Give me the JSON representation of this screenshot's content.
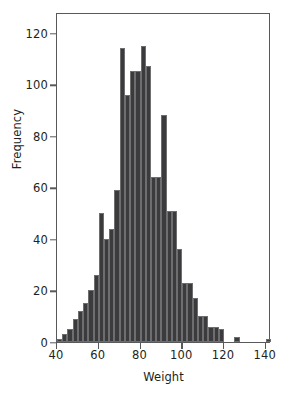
{
  "chart_data": {
    "type": "bar",
    "title": "",
    "subtitle": "",
    "xlabel": "Weight",
    "ylabel": "Frequency",
    "xlim": [
      40,
      142.5
    ],
    "ylim": [
      0,
      128
    ],
    "grid": false,
    "legend": null,
    "bin_width": 2.5,
    "bar_color": "#3b3b3d",
    "axis_color": "#58595b",
    "text_color": "#231f20",
    "xticks": [
      40,
      60,
      80,
      100,
      120,
      140
    ],
    "xtick_labels": [
      "40",
      "60",
      "80",
      "100",
      "120",
      "140"
    ],
    "yticks": [
      0,
      20,
      40,
      60,
      80,
      100,
      120
    ],
    "ytick_labels": [
      "0",
      "20",
      "40",
      "60",
      "80",
      "100",
      "120"
    ],
    "bins": [
      {
        "x0": 40.0,
        "x1": 42.5,
        "value": 1
      },
      {
        "x0": 42.5,
        "x1": 45.0,
        "value": 3
      },
      {
        "x0": 45.0,
        "x1": 47.5,
        "value": 5
      },
      {
        "x0": 47.5,
        "x1": 50.0,
        "value": 9
      },
      {
        "x0": 50.0,
        "x1": 52.5,
        "value": 12
      },
      {
        "x0": 52.5,
        "x1": 55.0,
        "value": 15
      },
      {
        "x0": 55.0,
        "x1": 57.5,
        "value": 20
      },
      {
        "x0": 57.5,
        "x1": 60.0,
        "value": 26
      },
      {
        "x0": 60.0,
        "x1": 62.5,
        "value": 50
      },
      {
        "x0": 62.5,
        "x1": 65.0,
        "value": 40
      },
      {
        "x0": 65.0,
        "x1": 67.5,
        "value": 44
      },
      {
        "x0": 67.5,
        "x1": 70.0,
        "value": 59
      },
      {
        "x0": 70.0,
        "x1": 72.5,
        "value": 114
      },
      {
        "x0": 72.5,
        "x1": 75.0,
        "value": 96
      },
      {
        "x0": 75.0,
        "x1": 77.5,
        "value": 105
      },
      {
        "x0": 77.5,
        "x1": 80.0,
        "value": 105
      },
      {
        "x0": 80.0,
        "x1": 82.5,
        "value": 115
      },
      {
        "x0": 82.5,
        "x1": 85.0,
        "value": 107
      },
      {
        "x0": 85.0,
        "x1": 87.5,
        "value": 64
      },
      {
        "x0": 87.5,
        "x1": 90.0,
        "value": 64
      },
      {
        "x0": 90.0,
        "x1": 92.5,
        "value": 88
      },
      {
        "x0": 92.5,
        "x1": 95.0,
        "value": 51
      },
      {
        "x0": 95.0,
        "x1": 97.5,
        "value": 51
      },
      {
        "x0": 97.5,
        "x1": 100.0,
        "value": 36
      },
      {
        "x0": 100.0,
        "x1": 102.5,
        "value": 23
      },
      {
        "x0": 102.5,
        "x1": 105.0,
        "value": 23
      },
      {
        "x0": 105.0,
        "x1": 107.5,
        "value": 17
      },
      {
        "x0": 107.5,
        "x1": 110.0,
        "value": 10
      },
      {
        "x0": 110.0,
        "x1": 112.5,
        "value": 10
      },
      {
        "x0": 112.5,
        "x1": 115.0,
        "value": 6
      },
      {
        "x0": 115.0,
        "x1": 117.5,
        "value": 6
      },
      {
        "x0": 117.5,
        "x1": 120.0,
        "value": 5
      },
      {
        "x0": 120.0,
        "x1": 122.5,
        "value": 0
      },
      {
        "x0": 122.5,
        "x1": 125.0,
        "value": 0
      },
      {
        "x0": 125.0,
        "x1": 127.5,
        "value": 2
      },
      {
        "x0": 127.5,
        "x1": 130.0,
        "value": 0
      },
      {
        "x0": 130.0,
        "x1": 132.5,
        "value": 0
      },
      {
        "x0": 132.5,
        "x1": 135.0,
        "value": 0
      },
      {
        "x0": 135.0,
        "x1": 137.5,
        "value": 0
      },
      {
        "x0": 137.5,
        "x1": 140.0,
        "value": 0
      },
      {
        "x0": 140.0,
        "x1": 142.5,
        "value": 1
      }
    ]
  }
}
